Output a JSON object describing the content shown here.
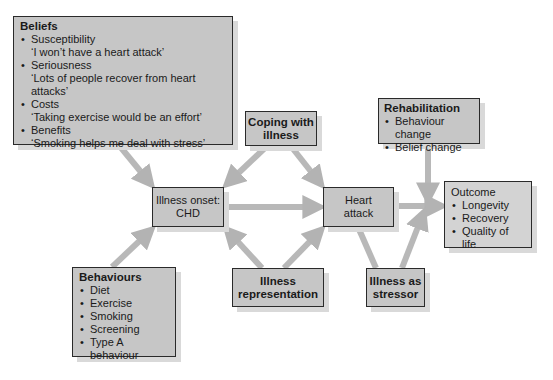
{
  "diagram": {
    "beliefs": {
      "title": "Beliefs",
      "items": [
        {
          "label": "Susceptibility",
          "quote": "‘I won’t have a heart attack’"
        },
        {
          "label": "Seriousness",
          "quote": "‘Lots of people recover from heart attacks’"
        },
        {
          "label": "Costs",
          "quote": "‘Taking exercise would be an effort’"
        },
        {
          "label": "Benefits",
          "quote": "‘Smoking helps me deal with stress’"
        }
      ]
    },
    "coping": {
      "line1": "Coping with",
      "line2": "illness"
    },
    "rehabilitation": {
      "title": "Rehabilitation",
      "items": [
        "Behaviour change",
        "Belief change"
      ]
    },
    "illness_onset": {
      "line1": "Illness onset:",
      "line2": "CHD"
    },
    "heart_attack": {
      "line1": "Heart",
      "line2": "attack"
    },
    "outcome": {
      "title": "Outcome",
      "items": [
        "Longevity",
        "Recovery",
        "Quality of life"
      ]
    },
    "behaviours": {
      "title": "Behaviours",
      "items": [
        "Diet",
        "Exercise",
        "Smoking",
        "Screening",
        "Type A behaviour"
      ]
    },
    "illness_representation": {
      "line1": "Illness",
      "line2": "representation"
    },
    "illness_stressor": {
      "line1": "Illness as",
      "line2": "stressor"
    },
    "colors": {
      "box_fill": "#c6c6c6",
      "arrow": "#b8b8b8",
      "border": "#2a2a2a",
      "shadow": "#d9d9d9"
    }
  }
}
